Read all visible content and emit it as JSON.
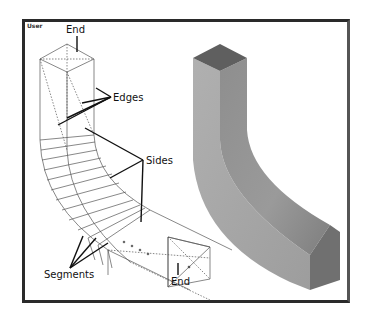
{
  "viewport": {
    "label": "User"
  },
  "wireframe": {
    "labels": {
      "end_top": "End",
      "edges": "Edges",
      "sides": "Sides",
      "segments": "Segments",
      "end_bottom": "End"
    }
  },
  "shaded_model": {
    "top_face_color": "#5f5f5f",
    "front_face_color": "#a9a9a9",
    "side_face_color": "#8a8a8a",
    "end_face_color": "#707070"
  },
  "colors": {
    "frame": "#2a2a2a",
    "wire": "#555555",
    "leader": "#111111"
  }
}
